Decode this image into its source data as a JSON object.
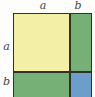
{
  "figure": {
    "background_color": "#fdfdfb",
    "stroke_color": "#2e3326"
  },
  "chart_data": {
    "type": "area",
    "xlabel": "",
    "ylabel": "",
    "grid": false,
    "legend_position": "none",
    "x": [
      "a",
      "b"
    ],
    "categories": [
      "a",
      "b"
    ],
    "series": [
      {
        "name": "a",
        "values": [
          "a²",
          "ab"
        ]
      },
      {
        "name": "b",
        "values": [
          "ab",
          "b²"
        ]
      }
    ],
    "annotations": [
      {
        "text": "a",
        "position": "top-left-segment"
      },
      {
        "text": "b",
        "position": "top-right-segment"
      },
      {
        "text": "a",
        "position": "left-upper-segment"
      },
      {
        "text": "b",
        "position": "left-lower-segment"
      }
    ]
  },
  "labels": {
    "top_a": "a",
    "top_b": "b",
    "left_a": "a",
    "left_b": "b"
  },
  "regions": [
    {
      "key": "a_squared",
      "name": "a-squared-region",
      "term": "a²",
      "color": "#f4efa6",
      "position": "top-left"
    },
    {
      "key": "ab_right",
      "name": "ab-region-right",
      "term": "ab",
      "color": "#76b076",
      "position": "top-right"
    },
    {
      "key": "ab_bottom",
      "name": "ab-region-bottom",
      "term": "ab",
      "color": "#76b076",
      "position": "bottom-left"
    },
    {
      "key": "b_squared",
      "name": "b-squared-region",
      "term": "b²",
      "color": "#6d9ecb",
      "position": "bottom-right"
    }
  ],
  "colors": {
    "yellow": "#f4efa6",
    "green": "#76b076",
    "blue": "#6d9ecb",
    "stroke": "#2e3326",
    "background": "#fdfdfb",
    "label_text": "#2b2b28"
  }
}
